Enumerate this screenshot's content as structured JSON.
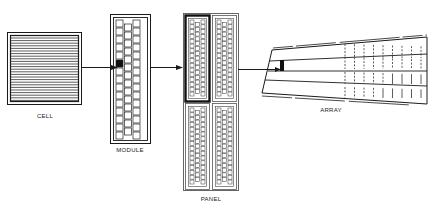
{
  "diagram": {
    "type": "hierarchy-flow",
    "stroke_color": "#1a1a1a",
    "background": "#ffffff",
    "nodes": [
      {
        "id": "cell",
        "label": "CELL"
      },
      {
        "id": "module",
        "label": "MODULE"
      },
      {
        "id": "panel",
        "label": "PANEL"
      },
      {
        "id": "array",
        "label": "ARRAY"
      }
    ],
    "edges": [
      {
        "from": "cell",
        "to": "module"
      },
      {
        "from": "module",
        "to": "panel"
      },
      {
        "from": "panel",
        "to": "array"
      }
    ]
  }
}
